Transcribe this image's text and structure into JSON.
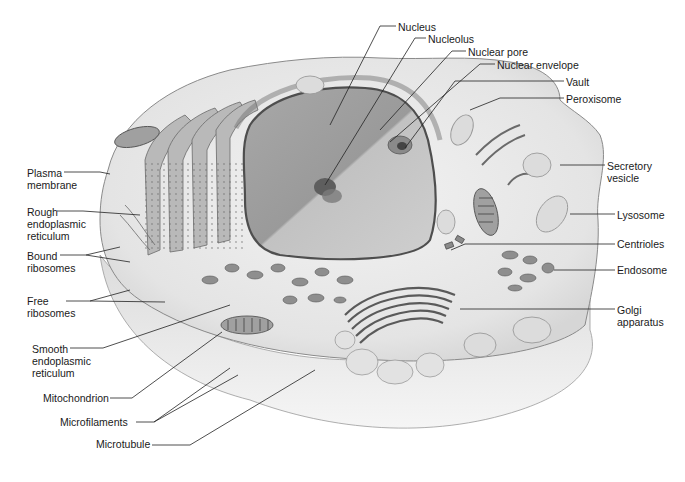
{
  "figure": {
    "background_color": "#ffffff",
    "cytoplasm_color": "#ececec",
    "nucleus_color": "#9a9a9a",
    "label_color": "#1a1a1a",
    "leader_line_color": "#222222"
  },
  "labels": {
    "left": [
      {
        "id": "plasma-membrane",
        "text": "Plasma\nmembrane",
        "x": 27,
        "y": 167
      },
      {
        "id": "rough-er",
        "text": "Rough\nendoplasmic\nreticulum",
        "x": 27,
        "y": 206
      },
      {
        "id": "bound-ribosomes",
        "text": "Bound\nribosomes",
        "x": 27,
        "y": 250
      },
      {
        "id": "free-ribosomes",
        "text": "Free\nribosomes",
        "x": 27,
        "y": 295
      },
      {
        "id": "smooth-er",
        "text": "Smooth\nendoplasmic\nreticulum",
        "x": 32,
        "y": 343
      },
      {
        "id": "mitochondrion",
        "text": "Mitochondrion",
        "x": 43,
        "y": 392
      },
      {
        "id": "microfilaments",
        "text": "Microfilaments",
        "x": 60,
        "y": 416
      },
      {
        "id": "microtubule",
        "text": "Microtubule",
        "x": 96,
        "y": 438
      }
    ],
    "top": [
      {
        "id": "nucleus",
        "text": "Nucleus",
        "x": 398,
        "y": 21
      },
      {
        "id": "nucleolus",
        "text": "Nucleolus",
        "x": 428,
        "y": 33
      },
      {
        "id": "nuclear-pore",
        "text": "Nuclear pore",
        "x": 468,
        "y": 46
      },
      {
        "id": "nuclear-envelope",
        "text": "Nuclear envelope",
        "x": 497,
        "y": 59
      }
    ],
    "right": [
      {
        "id": "vault",
        "text": "Vault",
        "x": 566,
        "y": 76
      },
      {
        "id": "peroxisome",
        "text": "Peroxisome",
        "x": 566,
        "y": 93
      },
      {
        "id": "secretory-vesicle",
        "text": "Secretory\nvesicle",
        "x": 607,
        "y": 160
      },
      {
        "id": "lysosome",
        "text": "Lysosome",
        "x": 617,
        "y": 209
      },
      {
        "id": "centrioles",
        "text": "Centrioles",
        "x": 617,
        "y": 238
      },
      {
        "id": "endosome",
        "text": "Endosome",
        "x": 617,
        "y": 264
      },
      {
        "id": "golgi-apparatus",
        "text": "Golgi\napparatus",
        "x": 617,
        "y": 304
      }
    ]
  }
}
